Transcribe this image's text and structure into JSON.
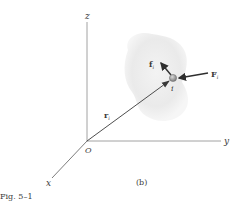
{
  "figure": {
    "caption": "Fig. 5–1",
    "panel_label": "(b)"
  },
  "axes": {
    "origin_label": "O",
    "x_label": "x",
    "y_label": "y",
    "z_label": "z"
  },
  "particle": {
    "label": "i"
  },
  "vectors": {
    "position": {
      "symbol": "r",
      "subscript": "i"
    },
    "internal_force": {
      "symbol": "f",
      "subscript": "i"
    },
    "external_force": {
      "symbol": "F",
      "subscript": "i"
    }
  },
  "colors": {
    "axis": "#8a8a8a",
    "vector": "#3a3a3a",
    "body_fill": "#e8e8e8",
    "particle": "#9a9a9a",
    "text": "#3a3a3a"
  }
}
